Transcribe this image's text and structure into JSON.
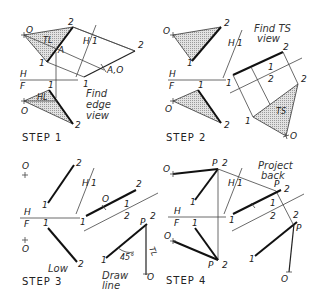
{
  "figure": {
    "panels": [
      {
        "id": "step1",
        "caption": "STEP 1",
        "note": [
          "Find",
          "edge",
          "view"
        ],
        "labels": {
          "o_top": "O",
          "two_top": "2",
          "tl": "TL",
          "a": "A",
          "one_top": "1",
          "h1_h": "H",
          "h1_1": "1",
          "aux_two": "2",
          "aux_a0": "A,O",
          "aux_one": "1",
          "hf_h": "H",
          "hf_f": "F",
          "one_front": "1",
          "hl": "HL",
          "o_front": "O",
          "two_front": "2"
        }
      },
      {
        "id": "step2",
        "caption": "STEP 2",
        "note": [
          "Find TS",
          "view"
        ],
        "labels": {
          "o_top": "O",
          "two_top": "2",
          "one_top": "1",
          "h1_h": "H",
          "h1_1": "1",
          "hf_h": "H",
          "hf_f": "F",
          "one_front": "1",
          "o_front": "O",
          "two_front": "2",
          "ev_one": "1",
          "ev_two": "2",
          "f12_1": "1",
          "f12_2": "2",
          "ts_two": "2",
          "ts_one": "1",
          "ts_o": "O",
          "ts": "TS"
        }
      },
      {
        "id": "step3",
        "caption": "STEP 3",
        "note_low": "Low",
        "note": [
          "Draw",
          "line"
        ],
        "labels": {
          "o_top": "O",
          "two_top": "2",
          "one_top": "1",
          "h1_h": "H",
          "h1_1": "1",
          "hf_h": "H",
          "hf_f": "F",
          "one_front": "1",
          "o_front": "O",
          "two_front": "2",
          "ev_one": "1",
          "ev_o": "O",
          "ev_two": "2",
          "f12_1": "1",
          "f12_2": "2",
          "ts_p": "P",
          "ts_two": "2",
          "ts_one": "1",
          "angle": "45°",
          "tl": "TL",
          "ts_o": "O"
        }
      },
      {
        "id": "step4",
        "caption": "STEP 4",
        "note": [
          "Project",
          "back"
        ],
        "labels": {
          "o_top": "O",
          "p_top": "P",
          "two_top": "2",
          "one_top": "1",
          "h1_h": "H",
          "h1_1": "1",
          "hf_h": "H",
          "hf_f": "F",
          "one_front": "1",
          "o_front": "O",
          "p_front": "P",
          "two_front": "2",
          "ev_one": "1",
          "ev_p": "P",
          "ev_two": "2",
          "f12_1": "1",
          "f12_2": "2",
          "ts_two": "2",
          "ts_p": "P",
          "ts_one": "1",
          "ts_o": "O"
        }
      }
    ]
  }
}
